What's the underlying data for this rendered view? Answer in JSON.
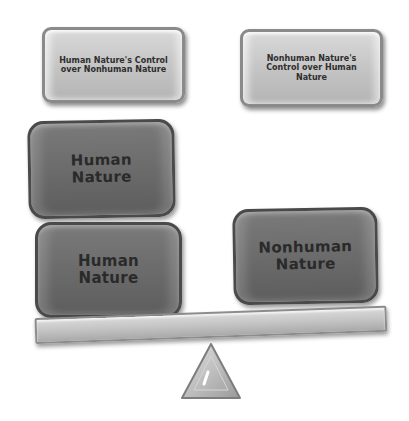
{
  "diagram": {
    "type": "balance-scale",
    "top_labels": [
      {
        "text": "Human Nature's Control over Nonhuman Nature"
      },
      {
        "text": "Nonhuman Nature's Control over Human Nature"
      }
    ],
    "left_pan": {
      "blocks": [
        {
          "text": "Human Nature"
        },
        {
          "text": "Human Nature"
        }
      ]
    },
    "right_pan": {
      "blocks": [
        {
          "text": "Nonhuman Nature"
        }
      ]
    },
    "colors": {
      "light_box": "#c4c4c4",
      "dark_box": "#6e6e6e",
      "beam": "#c0c0c0",
      "text": "#2a2a2a"
    }
  }
}
